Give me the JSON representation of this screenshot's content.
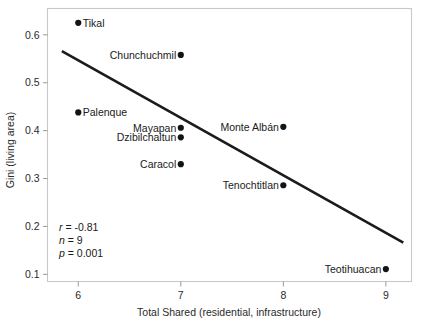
{
  "chart_data": {
    "type": "scatter",
    "title": "",
    "xlabel": "Total Shared (residential, infrastructure)",
    "ylabel": "Gini (living area)",
    "xlim": [
      5.7,
      9.25
    ],
    "ylim": [
      0.085,
      0.655
    ],
    "xticks": [
      6,
      7,
      8,
      9
    ],
    "xtick_labels": [
      "6",
      "7",
      "8",
      "9"
    ],
    "yticks": [
      0.1,
      0.2,
      0.3,
      0.4,
      0.5,
      0.6
    ],
    "ytick_labels": [
      "0.1",
      "0.2",
      "0.3",
      "0.4",
      "0.5",
      "0.6"
    ],
    "grid": false,
    "legend": "none",
    "points": [
      {
        "label": "Tikal",
        "x": 6.0,
        "y": 0.625,
        "label_side": "right"
      },
      {
        "label": "Chunchuchmil",
        "x": 7.0,
        "y": 0.558,
        "label_side": "left"
      },
      {
        "label": "Palenque",
        "x": 6.0,
        "y": 0.438,
        "label_side": "right"
      },
      {
        "label": "Mayapan",
        "x": 7.0,
        "y": 0.406,
        "label_side": "left"
      },
      {
        "label": "Dzibilchaltun",
        "x": 7.0,
        "y": 0.386,
        "label_side": "left"
      },
      {
        "label": "Monte Albán",
        "x": 8.0,
        "y": 0.408,
        "label_side": "left"
      },
      {
        "label": "Caracol",
        "x": 7.0,
        "y": 0.33,
        "label_side": "left"
      },
      {
        "label": "Tenochtitlan",
        "x": 8.0,
        "y": 0.286,
        "label_side": "left"
      },
      {
        "label": "Teotihuacan",
        "x": 9.0,
        "y": 0.111,
        "label_side": "left"
      }
    ],
    "trend_line": {
      "x_start": 5.84,
      "y_start": 0.566,
      "x_end": 9.17,
      "y_end": 0.166
    },
    "annotations": {
      "r_symbol": "r",
      "r_value": " = -0.81",
      "n_symbol": "n",
      "n_value": " = 9",
      "p_symbol": "p",
      "p_value": " = 0.001"
    }
  },
  "colors": {
    "marker": "#141414",
    "trend": "#1b1b1b",
    "frame": "#c8c8c8",
    "text": "#1a1a1a",
    "background": "#ffffff"
  }
}
